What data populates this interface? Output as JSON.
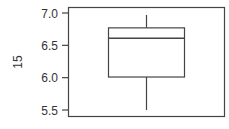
{
  "chart_data": {
    "type": "boxplot",
    "title": "",
    "xlabel": "",
    "ylabel": "15",
    "ylim": [
      5.45,
      7.05
    ],
    "yticks": [
      5.5,
      6.0,
      6.5,
      7.0
    ],
    "ytick_labels": [
      "5.5",
      "6.0",
      "6.5",
      "7.0"
    ],
    "grid": false,
    "series": [
      {
        "name": "15",
        "whisker_low": 5.5,
        "q1": 6.01,
        "median": 6.61,
        "q3": 6.77,
        "whisker_high": 6.97
      }
    ],
    "colors": {
      "line": "#444444",
      "box_fill": "#ffffff",
      "frame": "#444444"
    }
  }
}
